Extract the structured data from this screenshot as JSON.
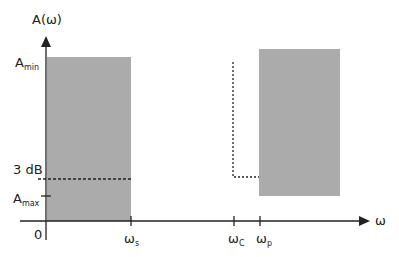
{
  "diagram": {
    "type": "filter-specification",
    "y_axis_label": "A(ω)",
    "x_axis_label": "ω",
    "origin_label": "0",
    "y_labels": {
      "a_min": {
        "main": "A",
        "sub": "min"
      },
      "three_db": "3 dB",
      "a_max": {
        "main": "A",
        "sub": "max"
      }
    },
    "x_labels": {
      "omega_s": {
        "main": "ω",
        "sub": "s"
      },
      "omega_c": {
        "main": "ω",
        "sub": "C"
      },
      "omega_p": {
        "main": "ω",
        "sub": "p"
      }
    },
    "colors": {
      "shaded_region": "#ababab",
      "axis": "#222222",
      "dotted": "#222222"
    }
  }
}
